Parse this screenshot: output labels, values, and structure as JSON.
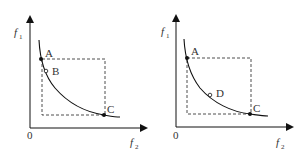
{
  "panels": [
    {
      "y_axis_label": "f",
      "y_axis_sub": "1",
      "x_axis_label": "f",
      "x_axis_sub": "2",
      "origin_label": "0",
      "points": [
        {
          "label": "A",
          "type": "filled"
        },
        {
          "label": "B",
          "type": "open"
        },
        {
          "label": "C",
          "type": "filled"
        }
      ]
    },
    {
      "y_axis_label": "f",
      "y_axis_sub": "1",
      "x_axis_label": "f",
      "x_axis_sub": "2",
      "origin_label": "0",
      "points": [
        {
          "label": "A",
          "type": "filled"
        },
        {
          "label": "D",
          "type": "open"
        },
        {
          "label": "C",
          "type": "filled"
        }
      ]
    }
  ]
}
